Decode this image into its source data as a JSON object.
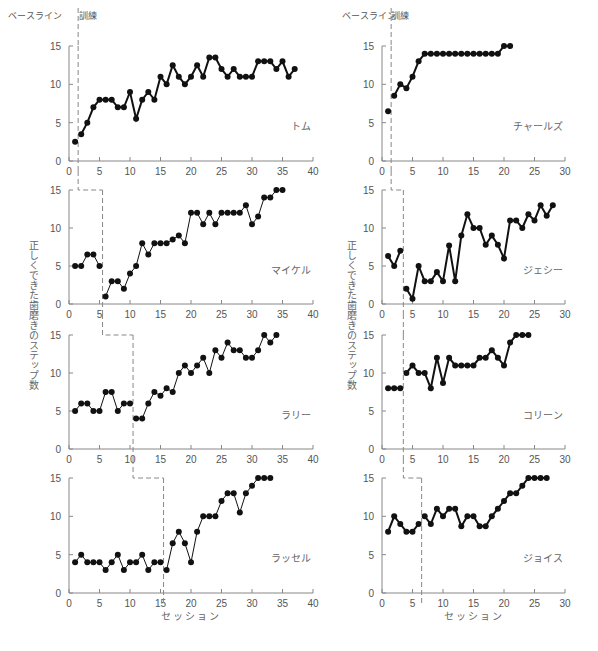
{
  "chart_data": {
    "type": "line",
    "title": "",
    "ylabel": "正しくできた歯磨きのステップ数",
    "xlabel": "セッション",
    "phase_labels": {
      "baseline": "ベースライン",
      "training": "訓練"
    },
    "grid": false,
    "legend": "none",
    "columns": [
      {
        "xlim": [
          0,
          40
        ],
        "xticks": [
          0,
          5,
          10,
          15,
          20,
          25,
          30,
          35,
          40
        ],
        "ylim": [
          0,
          15
        ],
        "yticks": [
          0,
          5,
          10,
          15
        ],
        "panels": [
          {
            "name": "トム",
            "phase_change_after": 1,
            "x": [
              1,
              2,
              3,
              4,
              5,
              6,
              7,
              8,
              9,
              10,
              11,
              12,
              13,
              14,
              15,
              16,
              17,
              18,
              19,
              20,
              21,
              22,
              23,
              24,
              25,
              26,
              27,
              28,
              29,
              30,
              31,
              32,
              33,
              34,
              35,
              36,
              37
            ],
            "y": [
              2.5,
              3.5,
              5,
              7,
              8,
              8,
              8,
              7,
              7,
              9,
              5.5,
              8,
              9,
              8,
              11,
              10,
              12.5,
              11,
              10,
              11,
              12.5,
              11,
              13.5,
              13.5,
              12,
              11,
              12,
              11,
              11,
              11,
              13,
              13,
              13,
              12,
              13,
              11,
              12
            ],
            "line_weight": "bold"
          },
          {
            "name": "マイケル",
            "phase_change_after": 5,
            "x": [
              1,
              2,
              3,
              4,
              5,
              6,
              7,
              8,
              9,
              10,
              11,
              12,
              13,
              14,
              15,
              16,
              17,
              18,
              19,
              20,
              21,
              22,
              23,
              24,
              25,
              26,
              27,
              28,
              29,
              30,
              31,
              32,
              33,
              34,
              35
            ],
            "y": [
              5,
              5,
              6.5,
              6.5,
              5,
              1,
              3,
              3,
              2,
              4,
              5,
              8,
              6.5,
              8,
              8,
              8,
              8.5,
              9,
              8,
              12,
              12,
              10.5,
              12,
              10.5,
              12,
              12,
              12,
              12,
              13,
              10.5,
              11.5,
              14,
              14,
              15,
              15
            ],
            "line_weight": "thin"
          },
          {
            "name": "ラリー",
            "phase_change_after": 10,
            "x": [
              1,
              2,
              3,
              4,
              5,
              6,
              7,
              8,
              9,
              10,
              11,
              12,
              13,
              14,
              15,
              16,
              17,
              18,
              19,
              20,
              21,
              22,
              23,
              24,
              25,
              26,
              27,
              28,
              29,
              30,
              31,
              32,
              33,
              34
            ],
            "y": [
              5,
              6,
              6,
              5,
              5,
              7.5,
              7.5,
              5,
              6,
              6,
              4,
              4,
              6,
              7.5,
              7,
              8,
              7.5,
              10,
              11,
              10,
              11,
              12,
              10,
              13,
              12,
              14,
              13,
              13,
              12,
              12,
              13,
              15,
              14,
              15
            ],
            "line_weight": "thin"
          },
          {
            "name": "ラッセル",
            "phase_change_after": 15,
            "x": [
              1,
              2,
              3,
              4,
              5,
              6,
              7,
              8,
              9,
              10,
              11,
              12,
              13,
              14,
              15,
              16,
              17,
              18,
              19,
              20,
              21,
              22,
              23,
              24,
              25,
              26,
              27,
              28,
              29,
              30,
              31,
              32,
              33
            ],
            "y": [
              4,
              5,
              4,
              4,
              4,
              3,
              4,
              5,
              3,
              4,
              4,
              5,
              3,
              4,
              4,
              3,
              6.5,
              8,
              6.5,
              4,
              8,
              10,
              10,
              10,
              12,
              13,
              13,
              10.5,
              13,
              14,
              15,
              15,
              15
            ],
            "line_weight": "thin"
          }
        ]
      },
      {
        "xlim": [
          0,
          30
        ],
        "xticks": [
          0,
          5,
          10,
          15,
          20,
          25,
          30
        ],
        "ylim": [
          0,
          15
        ],
        "yticks": [
          0,
          5,
          10,
          15
        ],
        "panels": [
          {
            "name": "チャールズ",
            "phase_change_after": 1,
            "x": [
              1,
              2,
              3,
              4,
              5,
              6,
              7,
              8,
              9,
              10,
              11,
              12,
              13,
              14,
              15,
              16,
              17,
              18,
              19,
              20,
              21
            ],
            "y": [
              6.5,
              8.5,
              10,
              9.5,
              11,
              13,
              14,
              14,
              14,
              14,
              14,
              14,
              14,
              14,
              14,
              14,
              14,
              14,
              14,
              15,
              15
            ],
            "line_weight": "bold"
          },
          {
            "name": "ジェシー",
            "phase_change_after": 3,
            "x": [
              1,
              2,
              3,
              4,
              5,
              6,
              7,
              8,
              9,
              10,
              11,
              12,
              13,
              14,
              15,
              16,
              17,
              18,
              19,
              20,
              21,
              22,
              23,
              24,
              25,
              26,
              27,
              28
            ],
            "y": [
              6.3,
              5,
              7,
              2,
              0.7,
              5,
              3,
              3,
              4.2,
              3,
              7.7,
              3,
              9,
              11.8,
              10,
              10,
              7.8,
              9,
              7.8,
              6,
              11,
              11,
              10,
              11.8,
              11,
              13,
              11.6,
              13
            ],
            "line_weight": "bold"
          },
          {
            "name": "コリーン",
            "phase_change_after": 3,
            "x": [
              1,
              2,
              3,
              4,
              5,
              6,
              7,
              8,
              9,
              10,
              11,
              12,
              13,
              14,
              15,
              16,
              17,
              18,
              19,
              20,
              21,
              22,
              23,
              24
            ],
            "y": [
              8,
              8,
              8,
              10,
              11,
              10,
              10,
              8,
              12,
              8.7,
              12,
              11,
              11,
              11,
              11,
              12,
              12,
              13,
              12,
              11,
              14,
              15,
              15,
              15
            ],
            "line_weight": "bold"
          },
          {
            "name": "ジョイス",
            "phase_change_after": 6,
            "x": [
              1,
              2,
              3,
              4,
              5,
              6,
              7,
              8,
              9,
              10,
              11,
              12,
              13,
              14,
              15,
              16,
              17,
              18,
              19,
              20,
              21,
              22,
              23,
              24,
              25,
              26,
              27
            ],
            "y": [
              8,
              10,
              9,
              8,
              8,
              9,
              10,
              9,
              11,
              10,
              11,
              11,
              8.7,
              10,
              10,
              8.7,
              8.7,
              10,
              11,
              12,
              13,
              13,
              14,
              15,
              15,
              15,
              15
            ],
            "line_weight": "bold"
          }
        ]
      }
    ]
  }
}
